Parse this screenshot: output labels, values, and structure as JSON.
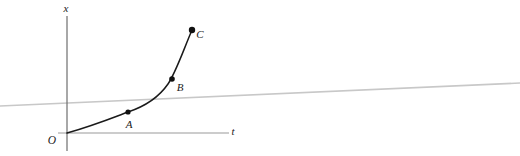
{
  "figure": {
    "type": "line-graph",
    "background_color": "#ffffff",
    "width": 520,
    "height": 156,
    "axes": {
      "vertical": {
        "label": "x",
        "label_position": {
          "x": 66,
          "y": 12
        },
        "color": "#6e6e6e",
        "x": 67,
        "y_top": 16,
        "y_bottom": 151
      },
      "horizontal": {
        "label": "t",
        "label_position": {
          "x": 233,
          "y": 135
        },
        "color": "#9a9a9a",
        "y": 133,
        "x_left": 58,
        "x_right": 229
      },
      "origin_label": "O",
      "origin_label_position": {
        "x": 52,
        "y": 144
      },
      "origin_point": {
        "x": 67,
        "y": 133
      }
    },
    "reference_line": {
      "name": "tangent-reference-line",
      "color": "#c8c8c8",
      "x1": 0,
      "y1": 106,
      "x2": 520,
      "y2": 83
    },
    "curve": {
      "name": "position-time-curve",
      "color": "#1a1a1a",
      "stroke_width": 1.5,
      "path": "M 67 133 C 92 126, 112 118, 128 112 C 146 106, 159 97, 168 84 C 176 72, 183 51, 192 30"
    },
    "points": [
      {
        "label": "A",
        "cx": 128,
        "cy": 112,
        "r": 2.6,
        "label_x": 129,
        "label_y": 128
      },
      {
        "label": "B",
        "cx": 172,
        "cy": 79,
        "r": 2.8,
        "label_x": 180,
        "label_y": 91
      },
      {
        "label": "C",
        "cx": 192,
        "cy": 30,
        "r": 3.2,
        "label_x": 200,
        "label_y": 38
      }
    ]
  },
  "chart_data": {
    "type": "line",
    "title": "",
    "xlabel": "t",
    "ylabel": "x",
    "grid": false,
    "legend": "none",
    "annotations": [
      "O",
      "A",
      "B",
      "C"
    ],
    "series": [
      {
        "name": "position-time-curve",
        "description": "Monotonically increasing, convex (upward-curving) x versus t curve originating at O, passing through labelled points A, B and C.",
        "points": [
          {
            "name": "O",
            "t": 0.0,
            "x": 0.0
          },
          {
            "name": "A",
            "t": 0.38,
            "x": 0.18
          },
          {
            "name": "B",
            "t": 0.65,
            "x": 0.46
          },
          {
            "name": "C",
            "t": 0.78,
            "x": 0.88
          }
        ]
      },
      {
        "name": "tangent-reference-line",
        "description": "Straight light-grey reference line crossing the figure with a small positive slope, intersecting the curve between A and B.",
        "points": [
          {
            "t": -0.41,
            "x": 0.23
          },
          {
            "t": 2.79,
            "x": 0.42
          }
        ]
      }
    ],
    "xlim": [
      0,
      1
    ],
    "ylim": [
      0,
      1
    ]
  }
}
